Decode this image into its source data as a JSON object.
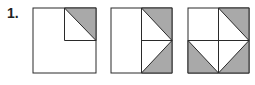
{
  "question": {
    "number": "1."
  },
  "colors": {
    "stroke": "#2a2a2a",
    "shade": "#a9a9a9",
    "background": "#ffffff"
  },
  "figures": [
    {
      "id": "figure-1",
      "description": "Square with a small top-right quarter square; the upper-right triangle of the small square is shaded"
    },
    {
      "id": "figure-2",
      "description": "Square split by vertical midline; right half contains a triangle pointing to the right edge midpoint, top-right and bottom-right corner triangles shaded"
    },
    {
      "id": "figure-3",
      "description": "Square split into quadrants; inner diamond-like triangles, with top-right, bottom-left and bottom-right corner triangles shaded"
    }
  ]
}
